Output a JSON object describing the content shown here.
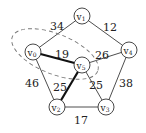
{
  "graph": {
    "nodes": [
      {
        "id": "v0",
        "name": "v",
        "sub": "0",
        "x": 33,
        "y": 52
      },
      {
        "id": "v1",
        "name": "v",
        "sub": "1",
        "x": 82,
        "y": 16
      },
      {
        "id": "v2",
        "name": "v",
        "sub": "2",
        "x": 57,
        "y": 107
      },
      {
        "id": "v3",
        "name": "v",
        "sub": "3",
        "x": 106,
        "y": 107
      },
      {
        "id": "v4",
        "name": "v",
        "sub": "4",
        "x": 129,
        "y": 50
      },
      {
        "id": "v5",
        "name": "v",
        "sub": "5",
        "x": 82,
        "y": 65
      }
    ],
    "edges": [
      {
        "from": "v0",
        "to": "v1",
        "weight": "34",
        "bold": false,
        "lx": 57,
        "ly": 27
      },
      {
        "from": "v1",
        "to": "v4",
        "weight": "12",
        "bold": false,
        "lx": 110,
        "ly": 28
      },
      {
        "from": "v0",
        "to": "v5",
        "weight": "19",
        "bold": true,
        "lx": 62,
        "ly": 55
      },
      {
        "from": "v5",
        "to": "v4",
        "weight": "26",
        "bold": false,
        "lx": 102,
        "ly": 56
      },
      {
        "from": "v0",
        "to": "v2",
        "weight": "46",
        "bold": false,
        "lx": 32,
        "ly": 84
      },
      {
        "from": "v5",
        "to": "v2",
        "weight": "25",
        "bold": true,
        "lx": 60,
        "ly": 88
      },
      {
        "from": "v5",
        "to": "v3",
        "weight": "25",
        "bold": false,
        "lx": 96,
        "ly": 86
      },
      {
        "from": "v4",
        "to": "v3",
        "weight": "38",
        "bold": false,
        "lx": 126,
        "ly": 84
      },
      {
        "from": "v2",
        "to": "v3",
        "weight": "17",
        "bold": false,
        "lx": 81,
        "ly": 121
      }
    ],
    "cut_region": {
      "cx": 55,
      "cy": 54,
      "rx": 46,
      "ry": 20,
      "rotate": 22,
      "style": "dashed"
    },
    "colors": {
      "edge": "#3a3a3a",
      "bold_edge": "#111111",
      "node_stroke": "#333333",
      "dash": "#777777"
    }
  }
}
